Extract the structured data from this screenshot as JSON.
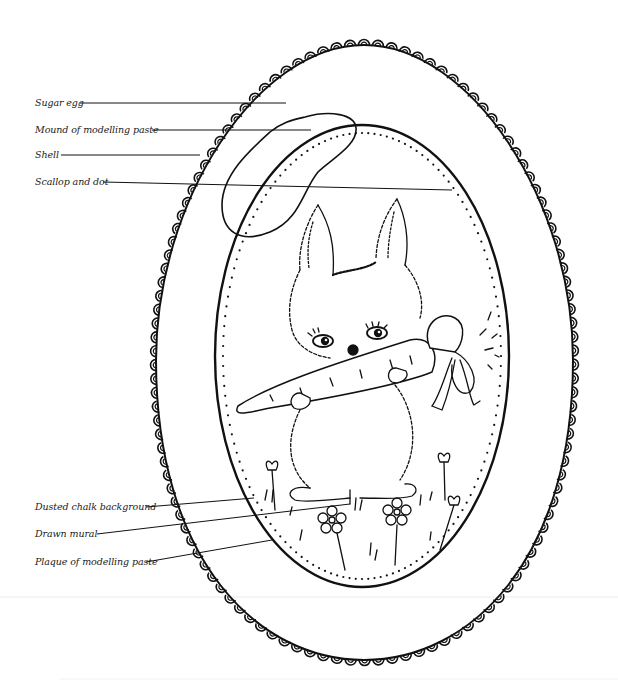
{
  "diagram": {
    "colors": {
      "ink": "#111111",
      "background": "#ffffff",
      "divider": "#ececec"
    },
    "labels": [
      {
        "id": "sugar-egg",
        "text": "Sugar egg",
        "x": 35,
        "y": 97,
        "line": [
          80,
          103,
          286,
          103
        ]
      },
      {
        "id": "mound",
        "text": "Mound of modelling paste",
        "x": 35,
        "y": 124,
        "line": [
          152,
          130,
          311,
          130
        ]
      },
      {
        "id": "shell",
        "text": "Shell",
        "x": 35,
        "y": 149,
        "line": [
          61,
          155,
          200,
          155
        ]
      },
      {
        "id": "scallop",
        "text": "Scallop and dot",
        "x": 35,
        "y": 176,
        "line": [
          103,
          182,
          452,
          190
        ]
      },
      {
        "id": "dusted",
        "text": "Dusted chalk background",
        "x": 35,
        "y": 501,
        "line": [
          146,
          507,
          254,
          498
        ]
      },
      {
        "id": "mural",
        "text": "Drawn mural",
        "x": 35,
        "y": 528,
        "line": [
          97,
          534,
          350,
          504
        ]
      },
      {
        "id": "plaque",
        "text": "Plaque of modelling paste",
        "x": 35,
        "y": 556,
        "line": [
          146,
          562,
          272,
          540
        ]
      }
    ]
  }
}
